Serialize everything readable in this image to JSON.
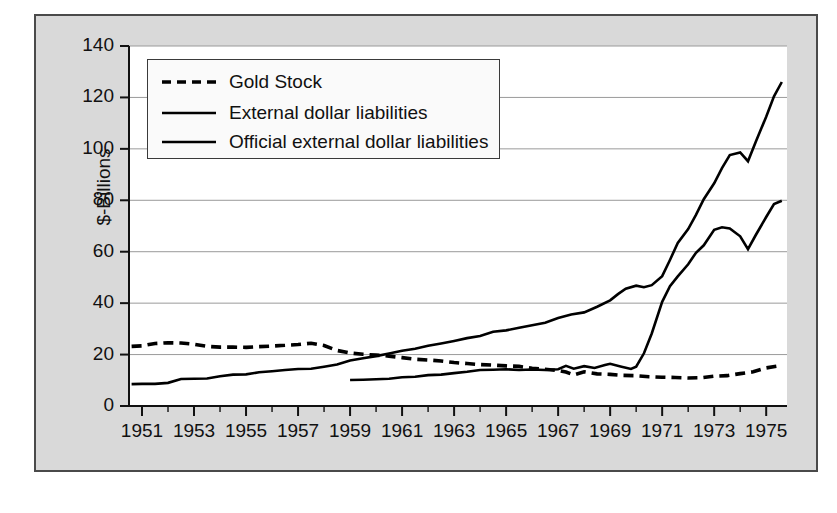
{
  "chart_data": {
    "type": "line",
    "title": "",
    "subtitle": "",
    "xlabel": "",
    "ylabel": "$-Billions",
    "xlim": [
      1950.5,
      1975.8
    ],
    "ylim": [
      0,
      140
    ],
    "grid": true,
    "grid_axis": "y",
    "legend_position": "upper-left-inside",
    "yticks": [
      0,
      20,
      40,
      60,
      80,
      100,
      120,
      140
    ],
    "ytick_labels": [
      "0",
      "20",
      "40",
      "60",
      "80",
      "100",
      "120",
      "140"
    ],
    "xticks": [
      1951,
      1953,
      1955,
      1957,
      1959,
      1961,
      1963,
      1965,
      1967,
      1969,
      1971,
      1973,
      1975
    ],
    "xtick_labels": [
      "1951",
      "1953",
      "1955",
      "1957",
      "1959",
      "1961",
      "1963",
      "1965",
      "1967",
      "1969",
      "1971",
      "1973",
      "1975"
    ],
    "xticks_minor": [
      1952,
      1954,
      1956,
      1958,
      1960,
      1962,
      1964,
      1966,
      1968,
      1970,
      1972,
      1974
    ],
    "series": [
      {
        "name": "Gold Stock",
        "style": "dashed",
        "color": "#000000",
        "x": [
          1950.6,
          1951.0,
          1951.5,
          1952.0,
          1952.5,
          1953.0,
          1953.5,
          1954.0,
          1954.5,
          1955.0,
          1955.5,
          1956.0,
          1956.5,
          1957.0,
          1957.5,
          1958.0,
          1958.5,
          1959.0,
          1959.5,
          1960.0,
          1960.5,
          1961.0,
          1961.5,
          1962.0,
          1962.5,
          1963.0,
          1963.5,
          1964.0,
          1964.5,
          1965.0,
          1965.5,
          1966.0,
          1966.5,
          1967.0,
          1967.3,
          1967.6,
          1968.0,
          1968.5,
          1969.0,
          1969.5,
          1970.0,
          1970.5,
          1971.0,
          1971.5,
          1972.0,
          1972.5,
          1973.0,
          1973.5,
          1974.0,
          1974.5,
          1975.0,
          1975.5
        ],
        "y": [
          23.2,
          23.4,
          24.3,
          24.6,
          24.5,
          24.0,
          23.2,
          22.9,
          22.9,
          22.8,
          23.1,
          23.3,
          23.6,
          23.9,
          24.4,
          23.5,
          21.6,
          20.6,
          20.1,
          19.8,
          19.4,
          18.8,
          18.2,
          17.9,
          17.5,
          16.9,
          16.5,
          16.1,
          15.9,
          15.6,
          15.4,
          14.7,
          14.3,
          13.8,
          13.2,
          12.1,
          13.3,
          12.5,
          12.3,
          11.9,
          11.8,
          11.4,
          11.2,
          11.1,
          10.9,
          11.0,
          11.6,
          11.8,
          12.6,
          13.3,
          14.8,
          15.6
        ]
      },
      {
        "name": "External dollar liabilities",
        "style": "solid",
        "color": "#000000",
        "x": [
          1950.6,
          1951.0,
          1951.5,
          1952.0,
          1952.5,
          1953.0,
          1953.5,
          1954.0,
          1954.5,
          1955.0,
          1955.5,
          1956.0,
          1956.5,
          1957.0,
          1957.5,
          1958.0,
          1958.5,
          1959.0,
          1959.5,
          1960.0,
          1960.5,
          1961.0,
          1961.5,
          1962.0,
          1962.5,
          1963.0,
          1963.5,
          1964.0,
          1964.5,
          1965.0,
          1965.5,
          1966.0,
          1966.5,
          1967.0,
          1967.5,
          1968.0,
          1968.5,
          1969.0,
          1969.3,
          1969.6,
          1970.0,
          1970.3,
          1970.6,
          1971.0,
          1971.3,
          1971.6,
          1972.0,
          1972.3,
          1972.6,
          1973.0,
          1973.3,
          1973.6,
          1974.0,
          1974.3,
          1974.6,
          1975.0,
          1975.3,
          1975.6
        ],
        "y": [
          8.5,
          8.6,
          8.6,
          9.0,
          10.5,
          10.6,
          10.7,
          11.6,
          12.2,
          12.3,
          13.1,
          13.5,
          14.0,
          14.4,
          14.5,
          15.3,
          16.1,
          17.7,
          18.6,
          19.4,
          20.4,
          21.5,
          22.3,
          23.4,
          24.3,
          25.3,
          26.4,
          27.2,
          28.9,
          29.4,
          30.4,
          31.4,
          32.4,
          34.2,
          35.6,
          36.4,
          38.6,
          41.1,
          43.5,
          45.6,
          46.8,
          46.2,
          47.0,
          50.5,
          56.8,
          63.4,
          68.8,
          74.3,
          80.4,
          86.6,
          92.5,
          97.6,
          98.6,
          95.2,
          102.8,
          112.5,
          120.4,
          126.0
        ]
      },
      {
        "name": "Official external dollar liabilities",
        "style": "solid",
        "color": "#000000",
        "x": [
          1959.0,
          1959.5,
          1960.0,
          1960.5,
          1961.0,
          1961.5,
          1962.0,
          1962.5,
          1963.0,
          1963.5,
          1964.0,
          1964.5,
          1965.0,
          1965.5,
          1966.0,
          1966.5,
          1967.0,
          1967.3,
          1967.6,
          1968.0,
          1968.4,
          1968.8,
          1969.0,
          1969.4,
          1969.8,
          1970.0,
          1970.3,
          1970.6,
          1971.0,
          1971.3,
          1971.6,
          1972.0,
          1972.3,
          1972.6,
          1973.0,
          1973.3,
          1973.6,
          1974.0,
          1974.3,
          1974.6,
          1975.0,
          1975.3,
          1975.6
        ],
        "y": [
          10.1,
          10.2,
          10.4,
          10.6,
          11.2,
          11.4,
          12.0,
          12.2,
          12.8,
          13.3,
          14.0,
          14.1,
          14.3,
          14.0,
          14.2,
          14.0,
          14.3,
          15.6,
          14.5,
          15.5,
          14.8,
          15.9,
          16.4,
          15.4,
          14.4,
          15.3,
          20.5,
          28.2,
          40.5,
          46.6,
          50.4,
          55.1,
          59.6,
          62.5,
          68.5,
          69.5,
          69.0,
          66.0,
          61.0,
          66.5,
          73.5,
          78.5,
          79.8
        ]
      }
    ]
  },
  "axis": {
    "ylabel": "$-Billions",
    "ytick_labels": [
      "140",
      "120",
      "100",
      "80",
      "60",
      "40",
      "20",
      "0"
    ],
    "xtick_labels": [
      "1951",
      "1953",
      "1955",
      "1957",
      "1959",
      "1961",
      "1963",
      "1965",
      "1967",
      "1969",
      "1971",
      "1973",
      "1975"
    ]
  },
  "legend": {
    "items": [
      {
        "label": "Gold Stock",
        "style": "dashed"
      },
      {
        "label": "External dollar liabilities",
        "style": "solid"
      },
      {
        "label": "Official external dollar liabilities",
        "style": "solid"
      }
    ]
  }
}
